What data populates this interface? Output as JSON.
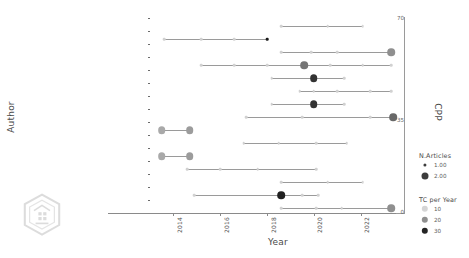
{
  "chart_data": {
    "type": "scatter",
    "title": "",
    "xlabel": "Year",
    "ylabel": "Author",
    "y2label": "CPP",
    "xlim": [
      2013.0,
      2023.6
    ],
    "xticks": [
      2014,
      2016,
      2018,
      2020,
      2022
    ],
    "xtick_labels": [
      "2014",
      "2016",
      "2018",
      "2020",
      "2022"
    ],
    "y2ticks": [
      0,
      35,
      70
    ],
    "y2tick_labels": [
      "0",
      "35",
      "70"
    ],
    "grid": false,
    "categories": [
      "COTTYN J",
      "KOSSEK EE",
      "PORTIOLI-STAUDACHER A",
      "HENAO CA",
      "DENG Q",
      "THÜRER M",
      "GONG G",
      "CIRILLO V",
      "PETRESCU AI",
      "MUÑOZ JC",
      "WHYMAN PB",
      "FERRER JC",
      "AGHEZZAF E-H",
      "TRIDICO P",
      "COSTA F"
    ],
    "series": [
      {
        "name": "COTTYN J",
        "start": 2018.6,
        "end": 2022.1,
        "points": [
          {
            "year": 2018.6,
            "n_articles": 1,
            "tc_per_year": 6
          },
          {
            "year": 2020.6,
            "n_articles": 1,
            "tc_per_year": 6
          },
          {
            "year": 2022.1,
            "n_articles": 1,
            "tc_per_year": 5
          }
        ]
      },
      {
        "name": "KOSSEK EE",
        "start": 2013.6,
        "end": 2018.0,
        "points": [
          {
            "year": 2013.6,
            "n_articles": 1,
            "tc_per_year": 6
          },
          {
            "year": 2015.2,
            "n_articles": 1,
            "tc_per_year": 6
          },
          {
            "year": 2016.6,
            "n_articles": 1,
            "tc_per_year": 6
          },
          {
            "year": 2018.0,
            "n_articles": 1,
            "tc_per_year": 34
          }
        ]
      },
      {
        "name": "PORTIOLI-STAUDACHER A",
        "start": 2018.6,
        "end": 2023.3,
        "points": [
          {
            "year": 2018.6,
            "n_articles": 1,
            "tc_per_year": 6
          },
          {
            "year": 2019.9,
            "n_articles": 1,
            "tc_per_year": 6
          },
          {
            "year": 2021.0,
            "n_articles": 1,
            "tc_per_year": 6
          },
          {
            "year": 2023.3,
            "n_articles": 2,
            "tc_per_year": 16
          }
        ]
      },
      {
        "name": "HENAO CA",
        "start": 2015.2,
        "end": 2023.3,
        "points": [
          {
            "year": 2015.2,
            "n_articles": 1,
            "tc_per_year": 6
          },
          {
            "year": 2016.6,
            "n_articles": 1,
            "tc_per_year": 6
          },
          {
            "year": 2018.0,
            "n_articles": 1,
            "tc_per_year": 6
          },
          {
            "year": 2019.6,
            "n_articles": 2,
            "tc_per_year": 20
          },
          {
            "year": 2020.7,
            "n_articles": 1,
            "tc_per_year": 6
          },
          {
            "year": 2022.1,
            "n_articles": 1,
            "tc_per_year": 6
          },
          {
            "year": 2023.3,
            "n_articles": 1,
            "tc_per_year": 6
          }
        ]
      },
      {
        "name": "DENG Q",
        "start": 2018.2,
        "end": 2021.3,
        "points": [
          {
            "year": 2018.2,
            "n_articles": 1,
            "tc_per_year": 6
          },
          {
            "year": 2020.0,
            "n_articles": 2,
            "tc_per_year": 30
          },
          {
            "year": 2021.3,
            "n_articles": 1,
            "tc_per_year": 6
          }
        ]
      },
      {
        "name": "THÜRER M",
        "start": 2019.4,
        "end": 2023.3,
        "points": [
          {
            "year": 2019.4,
            "n_articles": 1,
            "tc_per_year": 6
          },
          {
            "year": 2020.0,
            "n_articles": 1,
            "tc_per_year": 6
          },
          {
            "year": 2021.0,
            "n_articles": 1,
            "tc_per_year": 6
          },
          {
            "year": 2022.4,
            "n_articles": 1,
            "tc_per_year": 6
          },
          {
            "year": 2023.3,
            "n_articles": 1,
            "tc_per_year": 6
          }
        ]
      },
      {
        "name": "GONG G",
        "start": 2018.2,
        "end": 2021.3,
        "points": [
          {
            "year": 2018.2,
            "n_articles": 1,
            "tc_per_year": 6
          },
          {
            "year": 2020.0,
            "n_articles": 2,
            "tc_per_year": 30
          },
          {
            "year": 2021.3,
            "n_articles": 1,
            "tc_per_year": 6
          }
        ]
      },
      {
        "name": "CIRILLO V",
        "start": 2017.1,
        "end": 2023.4,
        "points": [
          {
            "year": 2017.1,
            "n_articles": 1,
            "tc_per_year": 6
          },
          {
            "year": 2019.5,
            "n_articles": 1,
            "tc_per_year": 6
          },
          {
            "year": 2022.4,
            "n_articles": 1,
            "tc_per_year": 6
          },
          {
            "year": 2023.4,
            "n_articles": 2,
            "tc_per_year": 22
          }
        ]
      },
      {
        "name": "PETRESCU AI",
        "start": 2013.5,
        "end": 2014.7,
        "points": [
          {
            "year": 2013.5,
            "n_articles": 2,
            "tc_per_year": 12
          },
          {
            "year": 2014.7,
            "n_articles": 2,
            "tc_per_year": 14
          }
        ]
      },
      {
        "name": "MUÑOZ JC",
        "start": 2017.0,
        "end": 2021.4,
        "points": [
          {
            "year": 2017.0,
            "n_articles": 1,
            "tc_per_year": 6
          },
          {
            "year": 2018.5,
            "n_articles": 1,
            "tc_per_year": 6
          },
          {
            "year": 2020.1,
            "n_articles": 1,
            "tc_per_year": 6
          },
          {
            "year": 2021.4,
            "n_articles": 1,
            "tc_per_year": 6
          }
        ]
      },
      {
        "name": "WHYMAN PB",
        "start": 2013.5,
        "end": 2014.7,
        "points": [
          {
            "year": 2013.5,
            "n_articles": 2,
            "tc_per_year": 12
          },
          {
            "year": 2014.7,
            "n_articles": 2,
            "tc_per_year": 14
          }
        ]
      },
      {
        "name": "FERRER JC",
        "start": 2014.6,
        "end": 2020.1,
        "points": [
          {
            "year": 2014.6,
            "n_articles": 1,
            "tc_per_year": 6
          },
          {
            "year": 2016.0,
            "n_articles": 1,
            "tc_per_year": 6
          },
          {
            "year": 2017.6,
            "n_articles": 1,
            "tc_per_year": 6
          },
          {
            "year": 2020.1,
            "n_articles": 1,
            "tc_per_year": 6
          }
        ]
      },
      {
        "name": "AGHEZZAF E-H",
        "start": 2018.6,
        "end": 2022.1,
        "points": [
          {
            "year": 2018.6,
            "n_articles": 1,
            "tc_per_year": 6
          },
          {
            "year": 2020.6,
            "n_articles": 1,
            "tc_per_year": 6
          },
          {
            "year": 2022.1,
            "n_articles": 1,
            "tc_per_year": 5
          }
        ]
      },
      {
        "name": "TRIDICO P",
        "start": 2014.9,
        "end": 2020.2,
        "points": [
          {
            "year": 2014.9,
            "n_articles": 1,
            "tc_per_year": 6
          },
          {
            "year": 2018.6,
            "n_articles": 2,
            "tc_per_year": 33
          },
          {
            "year": 2019.5,
            "n_articles": 1,
            "tc_per_year": 6
          },
          {
            "year": 2020.2,
            "n_articles": 1,
            "tc_per_year": 6
          }
        ]
      },
      {
        "name": "COSTA F",
        "start": 2018.6,
        "end": 2023.3,
        "points": [
          {
            "year": 2018.6,
            "n_articles": 1,
            "tc_per_year": 6
          },
          {
            "year": 2020.1,
            "n_articles": 1,
            "tc_per_year": 6
          },
          {
            "year": 2021.2,
            "n_articles": 1,
            "tc_per_year": 6
          },
          {
            "year": 2023.3,
            "n_articles": 2,
            "tc_per_year": 16
          }
        ]
      }
    ],
    "legends": [
      {
        "title": "N.Articles",
        "items": [
          {
            "label": "1.00",
            "size": 3.2,
            "color": "#3d3d3d"
          },
          {
            "label": "2.00",
            "size": 7.0,
            "color": "#3d3d3d"
          }
        ]
      },
      {
        "title": "TC per Year",
        "items": [
          {
            "label": "10",
            "size": 6.4,
            "color": "#d5d5d5"
          },
          {
            "label": "20",
            "size": 6.4,
            "color": "#8f8f8f"
          },
          {
            "label": "30",
            "size": 6.4,
            "color": "#242424"
          }
        ]
      }
    ],
    "colors": {
      "line": "#9a9a9a",
      "axis": "#8a8a8a",
      "text": "#4a4a4a",
      "low": "#d5d5d5",
      "mid": "#8f8f8f",
      "high": "#1f1f1f"
    }
  }
}
